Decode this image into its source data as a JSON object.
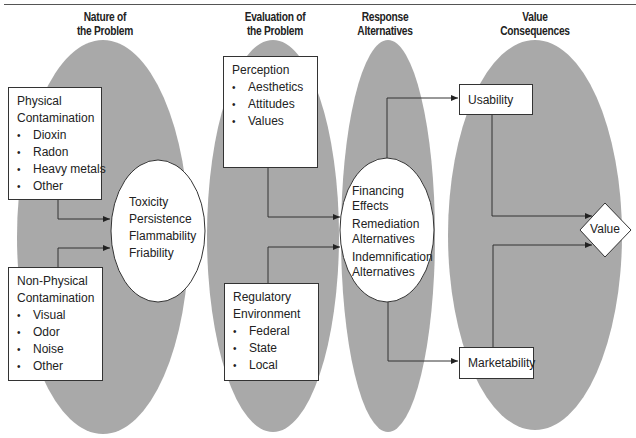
{
  "headers": {
    "nature": [
      "Nature of",
      "the Problem"
    ],
    "evaluation": [
      "Evaluation of",
      "the Problem"
    ],
    "response": [
      "Response",
      "Alternatives"
    ],
    "value": [
      "Value",
      "Consequences"
    ]
  },
  "nature": {
    "physical": {
      "title_line1": "Physical",
      "title_line2": "Contamination",
      "items": [
        "Dioxin",
        "Radon",
        "Heavy metals",
        "Other"
      ]
    },
    "non_physical": {
      "title_line1": "Non-Physical",
      "title_line2": "Contamination",
      "items": [
        "Visual",
        "Odor",
        "Noise",
        "Other"
      ]
    },
    "characteristics": [
      "Toxicity",
      "Persistence",
      "Flammability",
      "Friability"
    ]
  },
  "evaluation": {
    "perception": {
      "title": "Perception",
      "items": [
        "Aesthetics",
        "Attitudes",
        "Values"
      ]
    },
    "regulatory": {
      "title_line1": "Regulatory",
      "title_line2": "Environment",
      "items": [
        "Federal",
        "State",
        "Local"
      ]
    }
  },
  "response": {
    "groups": [
      [
        "Financing",
        "Effects"
      ],
      [
        "Remediation",
        "Alternatives"
      ],
      [
        "Indemnification",
        "Alternatives"
      ]
    ]
  },
  "consequences": {
    "usability": "Usability",
    "marketability": "Marketability",
    "value": "Value"
  },
  "colors": {
    "ellipse_fill": "#a9a9a9",
    "line": "#333333",
    "box_fill": "#ffffff"
  }
}
